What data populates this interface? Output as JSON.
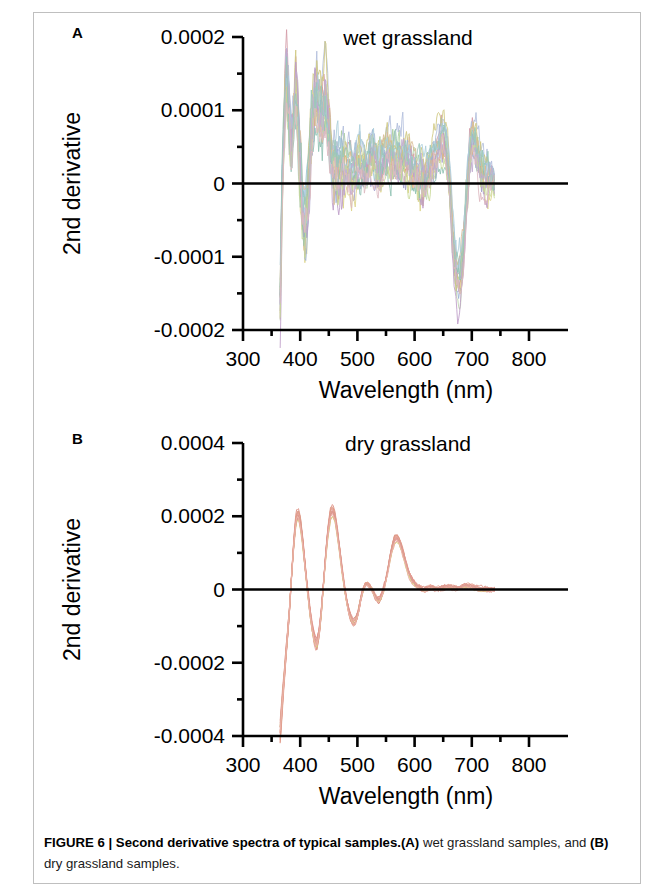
{
  "figure": {
    "caption_bold": "FIGURE 6 | Second derivative spectra of typical samples.",
    "caption_a_tag": "(A)",
    "caption_a_text": " wet grassland samples, and ",
    "caption_b_tag": "(B)",
    "caption_b_text": " dry grassland samples.",
    "panel_a_letter": "A",
    "panel_b_letter": "B"
  },
  "chart_data": [
    {
      "type": "line",
      "panel": "A",
      "title": "wet grassland",
      "xlabel": "Wavelength (nm)",
      "ylabel": "2nd derivative",
      "xlim": [
        300,
        800
      ],
      "ylim": [
        -0.0002,
        0.0002
      ],
      "xticks": [
        300,
        400,
        500,
        600,
        700,
        800
      ],
      "xtick_labels": [
        "300",
        "400",
        "500",
        "600",
        "700",
        "800"
      ],
      "xminor_step": 50,
      "yticks": [
        0.0002,
        0.0001,
        0,
        -0.0001,
        -0.0002
      ],
      "ytick_labels": [
        "0.0002",
        "0.0001",
        "0",
        "-0.0001",
        "-0.0002"
      ],
      "yminor_step": 5e-05,
      "grid": false,
      "legend": "none",
      "zero_line": true,
      "n_series": 18,
      "data_x_start": 365,
      "data_x_end": 740,
      "series_colors": [
        "#9a93c8",
        "#8fb8d8",
        "#9ec88f",
        "#d8cf7a",
        "#d9a05b",
        "#cf8f9c",
        "#a8b6d8",
        "#b4d0a0",
        "#8fa9cf",
        "#c9c06f",
        "#b58fc0",
        "#7fb9a8",
        "#d6b38a",
        "#9fc7d6",
        "#c2d48a",
        "#b9a0cb",
        "#8cc0b0",
        "#d9b0b8"
      ],
      "mean_curve": {
        "x": [
          365,
          368,
          372,
          376,
          380,
          384,
          388,
          392,
          396,
          400,
          404,
          408,
          412,
          416,
          420,
          424,
          428,
          432,
          436,
          440,
          444,
          448,
          452,
          456,
          460,
          464,
          468,
          472,
          476,
          480,
          486,
          492,
          498,
          504,
          510,
          516,
          522,
          528,
          534,
          540,
          546,
          552,
          558,
          564,
          570,
          576,
          582,
          588,
          594,
          600,
          606,
          612,
          618,
          624,
          630,
          636,
          642,
          648,
          652,
          656,
          660,
          664,
          668,
          672,
          676,
          680,
          684,
          688,
          692,
          696,
          700,
          704,
          708,
          712,
          716,
          720,
          726,
          732,
          738
        ],
        "y": [
          -0.000165,
          -2e-05,
          9e-05,
          0.00016,
          0.000115,
          4e-05,
          8.5e-05,
          0.00013,
          9e-05,
          2.5e-05,
          -2e-05,
          -6e-05,
          -4e-05,
          2e-05,
          7e-05,
          0.000105,
          0.00012,
          0.00011,
          9.5e-05,
          0.0001,
          0.000115,
          9e-05,
          6e-05,
          3.5e-05,
          2e-05,
          1.5e-05,
          1e-05,
          1.2e-05,
          1.8e-05,
          2.2e-05,
          1.8e-05,
          1.2e-05,
          2.2e-05,
          3e-05,
          2.6e-05,
          1.8e-05,
          2.4e-05,
          3.2e-05,
          3e-05,
          2.6e-05,
          3.4e-05,
          4e-05,
          3.6e-05,
          3e-05,
          2.6e-05,
          3e-05,
          3.4e-05,
          3e-05,
          2.2e-05,
          1.4e-05,
          8e-06,
          6e-06,
          1e-05,
          1.6e-05,
          2.6e-05,
          4e-05,
          5.4e-05,
          6.2e-05,
          5.8e-05,
          4e-05,
          1e-05,
          -3.5e-05,
          -8.5e-05,
          -0.00012,
          -0.000135,
          -0.00013,
          -0.000105,
          -6e-05,
          -5e-06,
          3.5e-05,
          5.8e-05,
          6.2e-05,
          5e-05,
          3.4e-05,
          2e-05,
          1.2e-05,
          8e-06,
          6e-06,
          4e-06
        ]
      },
      "features": [
        {
          "label": "UV-edge negative spike",
          "wavelength": 365,
          "value": -0.00016
        },
        {
          "label": "first major peak",
          "wavelength": 378,
          "value": 0.00017
        },
        {
          "label": "second peak",
          "wavelength": 393,
          "value": 0.00014
        },
        {
          "label": "negative dip",
          "wavelength": 408,
          "value": -7e-05
        },
        {
          "label": "blue band peak",
          "wavelength": 430,
          "value": 0.00013
        },
        {
          "label": "green region ripples",
          "wavelength": 555,
          "value": 4e-05
        },
        {
          "label": "red peak",
          "wavelength": 650,
          "value": 7e-05
        },
        {
          "label": "chlorophyll trough",
          "wavelength": 676,
          "value": -0.00019
        },
        {
          "label": "red-edge peak",
          "wavelength": 702,
          "value": 7e-05
        }
      ]
    },
    {
      "type": "line",
      "panel": "B",
      "title": "dry grassland",
      "xlabel": "Wavelength (nm)",
      "ylabel": "2nd derivative",
      "xlim": [
        300,
        800
      ],
      "ylim": [
        -0.0004,
        0.0004
      ],
      "xticks": [
        300,
        400,
        500,
        600,
        700,
        800
      ],
      "xtick_labels": [
        "300",
        "400",
        "500",
        "600",
        "700",
        "800"
      ],
      "xminor_step": 50,
      "yticks": [
        0.0004,
        0.0002,
        0,
        -0.0002,
        -0.0004
      ],
      "ytick_labels": [
        "0.0004",
        "0.0002",
        "0",
        "-0.0002",
        "-0.0004"
      ],
      "yminor_step": 0.0001,
      "grid": false,
      "legend": "none",
      "zero_line": true,
      "n_series": 14,
      "data_x_start": 365,
      "data_x_end": 740,
      "series_colors": [
        "#e8897f",
        "#e0786e",
        "#ea9b86",
        "#d9796f",
        "#e7a18c",
        "#dd8a7c",
        "#e59a90",
        "#d98b74",
        "#e8a294",
        "#dc8274",
        "#cfd36a",
        "#e3918a",
        "#d58a80",
        "#eaa79a"
      ],
      "mean_curve": {
        "x": [
          365,
          369,
          373,
          377,
          381,
          385,
          389,
          393,
          397,
          401,
          405,
          409,
          413,
          417,
          421,
          425,
          429,
          433,
          437,
          441,
          445,
          449,
          453,
          457,
          461,
          465,
          469,
          473,
          477,
          481,
          485,
          489,
          493,
          497,
          501,
          505,
          509,
          513,
          517,
          521,
          525,
          529,
          533,
          537,
          541,
          545,
          549,
          553,
          557,
          561,
          565,
          569,
          573,
          577,
          581,
          585,
          589,
          593,
          597,
          601,
          605,
          609,
          613,
          617,
          621,
          625,
          629,
          633,
          637,
          641,
          645,
          651,
          657,
          663,
          669,
          675,
          681,
          687,
          693,
          699,
          705,
          711,
          717,
          723,
          729,
          735,
          740
        ],
        "y": [
          -0.00039,
          -0.0003,
          -0.00022,
          -0.00014,
          -6e-05,
          4e-05,
          0.00013,
          0.000195,
          0.000205,
          0.000175,
          0.00012,
          5.5e-05,
          -5e-06,
          -6e-05,
          -0.000105,
          -0.00014,
          -0.00015,
          -0.00012,
          -6e-05,
          2e-05,
          0.0001,
          0.000165,
          0.000205,
          0.000215,
          0.000195,
          0.000155,
          0.000105,
          5.5e-05,
          1e-05,
          -3e-05,
          -6e-05,
          -8e-05,
          -9e-05,
          -8.5e-05,
          -6.5e-05,
          -3.5e-05,
          -8e-06,
          1e-05,
          1.6e-05,
          1.2e-05,
          2e-06,
          -1.2e-05,
          -2.5e-05,
          -3e-05,
          -2.2e-05,
          -5e-06,
          2e-05,
          5e-05,
          8.5e-05,
          0.000115,
          0.000135,
          0.00014,
          0.000132,
          0.000115,
          9.2e-05,
          6.8e-05,
          4.8e-05,
          3.2e-05,
          2e-05,
          1.2e-05,
          7e-06,
          4e-06,
          2e-06,
          1e-06,
          2e-06,
          4e-06,
          6e-06,
          5e-06,
          3e-06,
          2e-06,
          3e-06,
          5e-06,
          7e-06,
          6e-06,
          4e-06,
          3e-06,
          5e-06,
          8e-06,
          9e-06,
          7e-06,
          4e-06,
          2e-06,
          1e-06,
          0.0,
          0.0,
          0.0,
          0.0
        ]
      },
      "features": [
        {
          "label": "deep negative start",
          "wavelength": 365,
          "value": -0.00039
        },
        {
          "label": "first peak",
          "wavelength": 397,
          "value": 0.00021
        },
        {
          "label": "first trough",
          "wavelength": 429,
          "value": -0.00015
        },
        {
          "label": "second peak",
          "wavelength": 457,
          "value": 0.00022
        },
        {
          "label": "second trough",
          "wavelength": 493,
          "value": -9e-05
        },
        {
          "label": "minor ripple",
          "wavelength": 517,
          "value": 2e-05
        },
        {
          "label": "third peak",
          "wavelength": 569,
          "value": 0.00014
        },
        {
          "label": "flat tail",
          "wavelength": 700,
          "value": 5e-06
        }
      ]
    }
  ]
}
